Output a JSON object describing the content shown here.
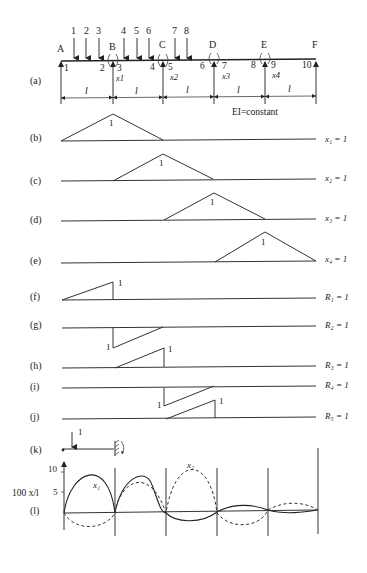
{
  "beam": {
    "supports": [
      "A",
      "B",
      "C",
      "D",
      "E",
      "F"
    ],
    "load_numbers": [
      "1",
      "2",
      "3",
      "4",
      "5",
      "6",
      "7",
      "8"
    ],
    "node_numbers": [
      "1",
      "2",
      "3",
      "4",
      "5",
      "6",
      "7",
      "8",
      "9",
      "10"
    ],
    "redundants": [
      "x1",
      "x2",
      "x3",
      "x4"
    ],
    "span_label": "l",
    "span_count": 5,
    "stiffness_note": "EI=constant"
  },
  "panels": [
    {
      "tag": "(a)",
      "label": ""
    },
    {
      "tag": "(b)",
      "label": "x₁ = 1",
      "peak": "1"
    },
    {
      "tag": "(c)",
      "label": "x₂ = 1",
      "peak": "1"
    },
    {
      "tag": "(d)",
      "label": "x₃ = 1",
      "peak": "1"
    },
    {
      "tag": "(e)",
      "label": "x₄ = 1",
      "peak": "1"
    },
    {
      "tag": "(f)",
      "label": "R₁ = 1",
      "peak": "1"
    },
    {
      "tag": "(g)",
      "label": "R₂ = 1",
      "peak": "1"
    },
    {
      "tag": "(h)",
      "label": "R₃ = 1",
      "peak": "1"
    },
    {
      "tag": "(i)",
      "label": "R₄ = 1",
      "peak": "1"
    },
    {
      "tag": "(j)",
      "label": "R₅ = 1",
      "peak": "1"
    },
    {
      "tag": "(k)",
      "label": "",
      "load": "1"
    },
    {
      "tag": "(l)",
      "label": ""
    }
  ],
  "plot": {
    "ylabel": "100 x/l",
    "yticks": [
      "10",
      "5"
    ],
    "series": [
      {
        "name": "x₁",
        "style": "solid"
      },
      {
        "name": "x₂",
        "style": "dashed"
      }
    ]
  }
}
